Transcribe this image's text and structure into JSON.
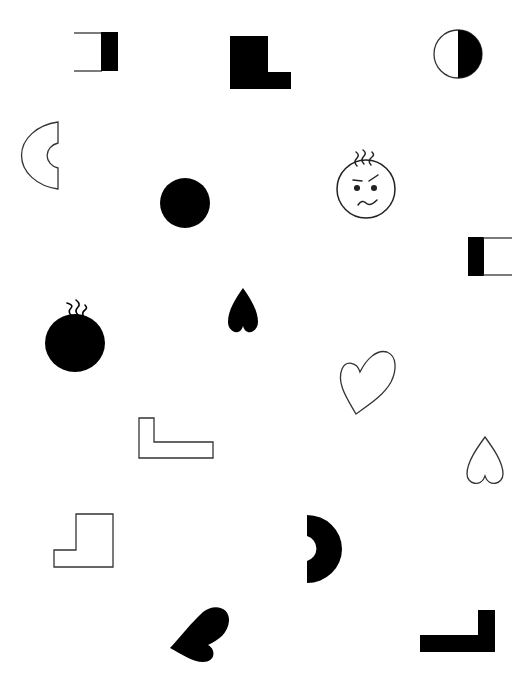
{
  "canvas": {
    "width": 530,
    "height": 690,
    "background": "#ffffff",
    "ink": "#000000",
    "stroke": "#333333"
  },
  "shapes": [
    {
      "id": 1,
      "type": "open-bracket-black-right",
      "fill": "black",
      "x": 74,
      "y": 32
    },
    {
      "id": 2,
      "type": "l-shape",
      "fill": "black",
      "x": 230,
      "y": 36
    },
    {
      "id": 3,
      "type": "half-filled-circle",
      "fill": "black-right-half",
      "cx": 458,
      "cy": 54
    },
    {
      "id": 4,
      "type": "c-arc",
      "fill": "outline",
      "x": 25,
      "y": 122
    },
    {
      "id": 5,
      "type": "annoyed-face",
      "fill": "outline",
      "cx": 366,
      "cy": 189
    },
    {
      "id": 6,
      "type": "circle",
      "fill": "black",
      "cx": 185,
      "cy": 203
    },
    {
      "id": 7,
      "type": "open-bracket-black-left",
      "fill": "black",
      "x": 468,
      "y": 237
    },
    {
      "id": 8,
      "type": "blob-with-hair",
      "fill": "black",
      "cx": 75,
      "cy": 343
    },
    {
      "id": 9,
      "type": "inverted-heart",
      "fill": "black",
      "x": 228,
      "y": 288
    },
    {
      "id": 10,
      "type": "tilted-heart",
      "fill": "outline",
      "x": 340,
      "y": 352
    },
    {
      "id": 11,
      "type": "l-shape",
      "fill": "outline",
      "x": 139,
      "y": 418
    },
    {
      "id": 12,
      "type": "inverted-heart",
      "fill": "outline",
      "x": 467,
      "y": 437
    },
    {
      "id": 13,
      "type": "step-shape",
      "fill": "outline",
      "x": 54,
      "y": 514
    },
    {
      "id": 14,
      "type": "d-arc",
      "fill": "black",
      "x": 307,
      "y": 515
    },
    {
      "id": 15,
      "type": "tilted-heart",
      "fill": "black",
      "x": 170,
      "y": 607
    },
    {
      "id": 16,
      "type": "mirrored-l-shape",
      "fill": "black",
      "x": 420,
      "y": 610
    }
  ]
}
